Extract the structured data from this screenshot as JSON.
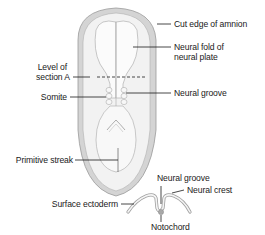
{
  "diagram": {
    "type": "anatomical-illustration",
    "colors": {
      "background": "#ffffff",
      "amnion_edge": "#cfcfcf",
      "embryo_fill": "#f0f0f0",
      "neural_fold": "#fafafa",
      "outline": "#9a9a9a",
      "leader_line": "#1a1a1a",
      "notochord": "#a8a8a8"
    },
    "labels": {
      "cut_edge_of_amnion": "Cut edge of amnion",
      "neural_fold_line1": "Neural fold of",
      "neural_fold_line2": "neural plate",
      "level_of_section_line1": "Level of",
      "level_of_section_line2": "section A",
      "somite": "Somite",
      "neural_groove_top": "Neural groove",
      "primitive_streak": "Primitive streak",
      "surface_ectoderm": "Surface ectoderm",
      "neural_groove_section": "Neural groove",
      "neural_crest": "Neural crest",
      "notochord": "Notochord"
    }
  }
}
